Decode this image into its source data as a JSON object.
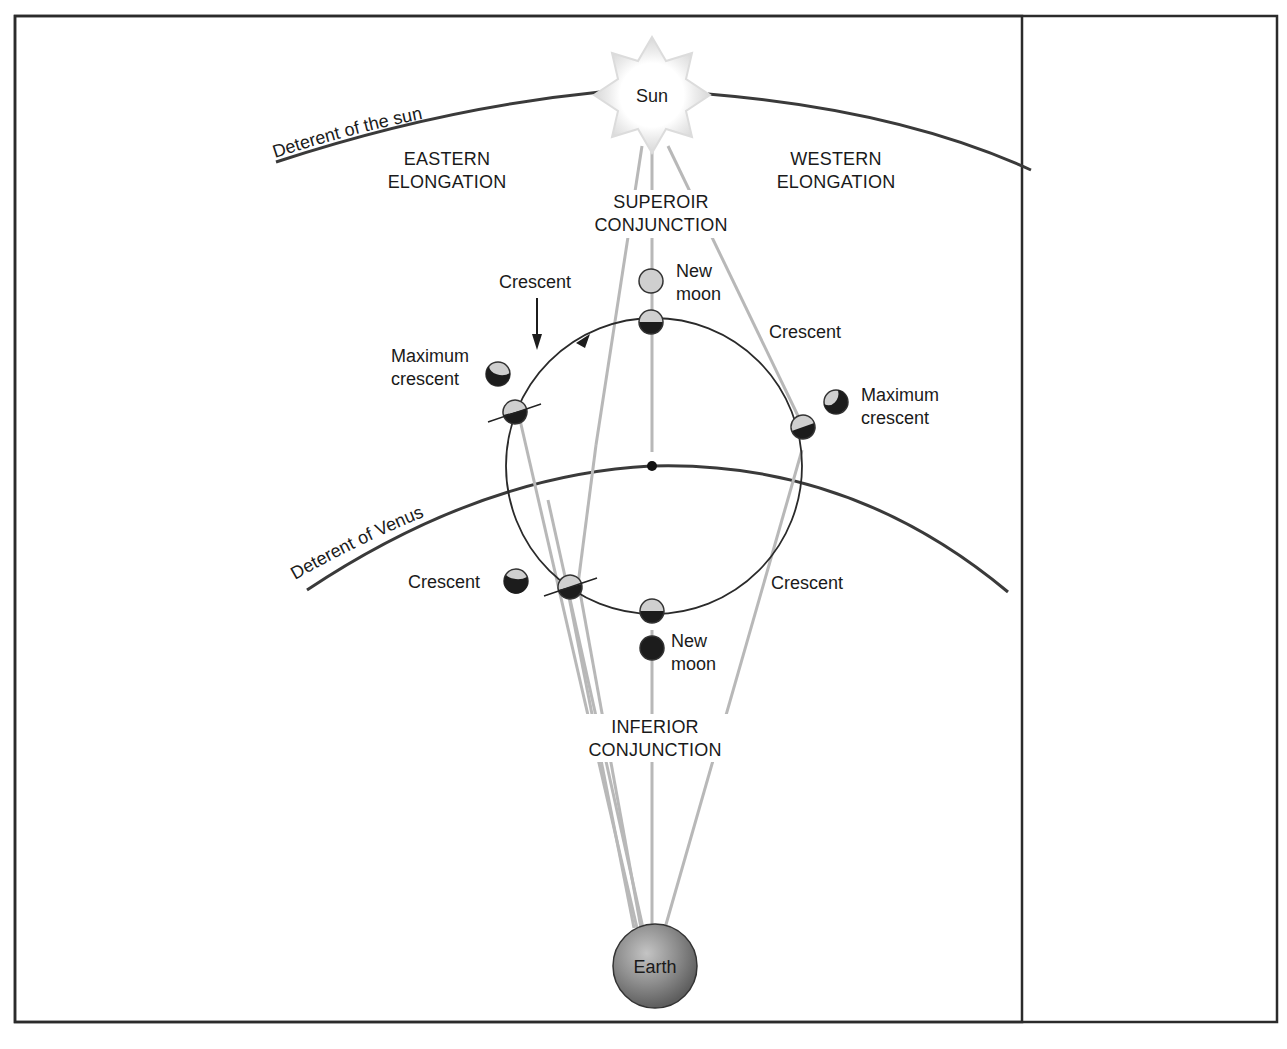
{
  "diagram": {
    "title_labels": {
      "sun": "Sun",
      "earth": "Earth",
      "deferent_sun": "Deterent of the sun",
      "deferent_venus": "Deterent of Venus",
      "eastern_1": "EASTERN",
      "eastern_2": "ELONGATION",
      "western_1": "WESTERN",
      "western_2": "ELONGATION",
      "superior_1": "SUPEROIR",
      "superior_2": "CONJUNCTION",
      "inferior_1": "INFERIOR",
      "inferior_2": "CONJUNCTION"
    },
    "phase_labels": {
      "top_new_1": "New",
      "top_new_2": "moon",
      "crescent_top_left": "Crescent",
      "crescent_top_right": "Crescent",
      "max_left_1": "Maximum",
      "max_left_2": "crescent",
      "max_right_1": "Maximum",
      "max_right_2": "crescent",
      "crescent_bottom_left": "Crescent",
      "crescent_bottom_right": "Crescent",
      "bottom_new_1": "New",
      "bottom_new_2": "moon"
    },
    "colors": {
      "line_dark": "#2a2a2a",
      "line_gray": "#b5b5b5",
      "planet_light": "#cfcfcf",
      "planet_dark": "#1c1c1c",
      "earth_fill": "#8a8a8a",
      "sun_glow": "#e6e6e6",
      "frame": "#2b2b2b"
    }
  }
}
